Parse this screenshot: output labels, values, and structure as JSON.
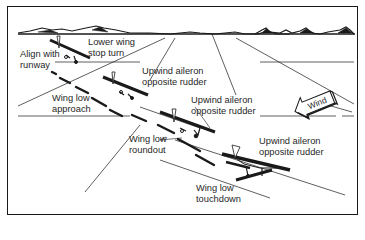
{
  "diagram": {
    "colors": {
      "ink": "#1a1a1a",
      "background": "#ffffff",
      "text": "#1f1f1f"
    },
    "labels": [
      {
        "id": "align",
        "lines": [
          "Align with",
          "runway"
        ]
      },
      {
        "id": "lower-wing",
        "lines": [
          "Lower wing",
          "stop turn"
        ]
      },
      {
        "id": "upwind-1",
        "lines": [
          "Upwind aileron",
          "opposite rudder"
        ]
      },
      {
        "id": "wing-low-approach",
        "lines": [
          "Wing low",
          "approach"
        ]
      },
      {
        "id": "upwind-2",
        "lines": [
          "Upwind aileron",
          "opposite rudder"
        ]
      },
      {
        "id": "wing-low-roundout",
        "lines": [
          "Wing low",
          "roundout"
        ]
      },
      {
        "id": "upwind-3",
        "lines": [
          "Upwind aileron",
          "opposite rudder"
        ]
      },
      {
        "id": "wing-low-touchdown",
        "lines": [
          "Wing low",
          "touchdown"
        ]
      }
    ],
    "wind_arrow": {
      "label": "Wind",
      "icon": "wind-arrow-icon"
    },
    "airplanes": [
      {
        "stage": "align-with-runway",
        "icon": "airplane-icon"
      },
      {
        "stage": "wing-low-approach",
        "icon": "airplane-icon"
      },
      {
        "stage": "wing-low-roundout",
        "icon": "airplane-icon"
      },
      {
        "stage": "wing-low-touchdown",
        "icon": "airplane-icon"
      }
    ]
  }
}
